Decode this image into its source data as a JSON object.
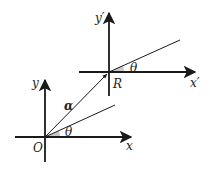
{
  "diagram": {
    "title": "",
    "frames": {
      "original": {
        "origin_label": "O",
        "x_axis_label": "x",
        "y_axis_label": "y",
        "angle_label": "θ"
      },
      "rotated": {
        "origin_label": "R",
        "x_axis_label": "x′",
        "y_axis_label": "y′",
        "angle_label": "θ"
      }
    },
    "vector_label": "α",
    "colors": {
      "stroke": "#1a1a1a",
      "angle_fill": "#c8c8c8",
      "background": "#ffffff"
    }
  }
}
